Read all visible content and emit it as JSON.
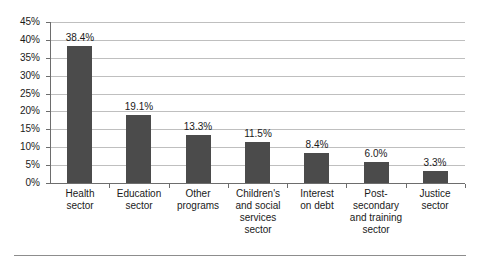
{
  "chart_data": {
    "type": "bar",
    "title": "",
    "subtitle": "",
    "xlabel": "",
    "ylabel": "",
    "ylim": [
      0,
      45
    ],
    "ytick_step": 5,
    "grid": true,
    "legend": "none",
    "orientation": "vertical",
    "bar_color": "#4b4b4b",
    "value_label_suffix": "%",
    "categories": [
      "Health sector",
      "Education sector",
      "Other programs",
      "Children's and social services sector",
      "Interest on debt",
      "Post-secondary and training sector",
      "Justice sector"
    ],
    "category_lines": [
      [
        "Health",
        "sector"
      ],
      [
        "Education",
        "sector"
      ],
      [
        "Other",
        "programs"
      ],
      [
        "Children's",
        "and social",
        "services",
        "sector"
      ],
      [
        "Interest",
        "on debt"
      ],
      [
        "Post-",
        "secondary",
        "and training",
        "sector"
      ],
      [
        "Justice",
        "sector"
      ]
    ],
    "values": [
      38.4,
      19.1,
      13.3,
      11.5,
      8.4,
      6.0,
      3.3
    ],
    "value_labels": [
      "38.4%",
      "19.1%",
      "13.3%",
      "11.5%",
      "8.4%",
      "6.0%",
      "3.3%"
    ],
    "ytick_labels": [
      "45%",
      "40%",
      "35%",
      "30%",
      "25%",
      "20%",
      "15%",
      "10%",
      "5%",
      "0%"
    ],
    "ytick_values": [
      45,
      40,
      35,
      30,
      25,
      20,
      15,
      10,
      5,
      0
    ]
  }
}
